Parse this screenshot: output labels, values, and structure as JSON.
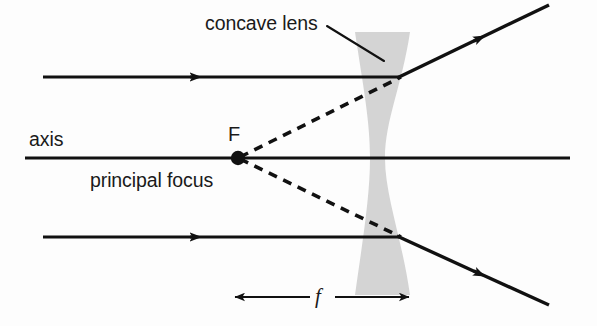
{
  "figure": {
    "kind": "ray-diagram",
    "subject": "concave lens",
    "background_color": "#fdfdfd",
    "ink_color": "#111111",
    "lens_fill_color": "#d4d4d4"
  },
  "labels": {
    "concave_lens": "concave lens",
    "axis": "axis",
    "focus_point": "F",
    "principal_focus": "principal focus",
    "focal_length": "f"
  },
  "geometry": {
    "canvas": {
      "width": 597,
      "height": 326
    },
    "axis": {
      "y": 158,
      "x_start": 25,
      "x_end": 570
    },
    "lens": {
      "x_left_outer": 355,
      "x_right_outer": 410,
      "x_waist_left": 370,
      "x_waist_right": 385,
      "y_top": 32,
      "y_bottom": 295
    },
    "focal_point": {
      "x": 238,
      "y": 158
    },
    "incident_rays": [
      {
        "x_start": 43,
        "y": 77,
        "x_end": 398,
        "arrow_x": 196
      },
      {
        "x_start": 43,
        "y": 237,
        "x_end": 398,
        "arrow_x": 196
      }
    ],
    "refracted_rays": [
      {
        "x1": 398,
        "y1": 78,
        "x2": 548,
        "y2": 6,
        "arrow_t": 0.54
      },
      {
        "x1": 398,
        "y1": 236,
        "x2": 548,
        "y2": 304,
        "arrow_t": 0.54
      }
    ],
    "virtual_rays": [
      {
        "x1": 240,
        "y1": 157,
        "x2": 400,
        "y2": 78
      },
      {
        "x1": 240,
        "y1": 159,
        "x2": 400,
        "y2": 236
      }
    ],
    "leader_line": {
      "x1": 327,
      "y1": 26,
      "x2": 383,
      "y2": 60
    },
    "focal_length_marker": {
      "x_left": 234,
      "x_right": 409,
      "y": 297
    }
  }
}
